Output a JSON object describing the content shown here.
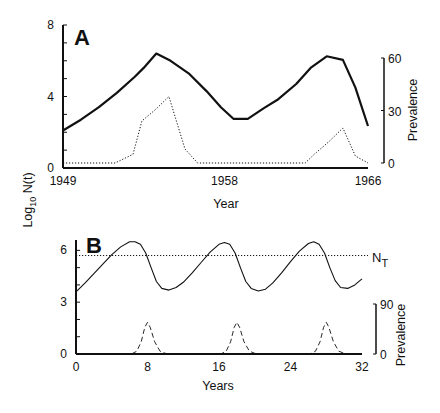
{
  "chart_data": [
    {
      "panel": "A",
      "type": "line",
      "panel_label": "A",
      "xlabel": "Year",
      "ylabel": "Log10 N(t)",
      "ylabel_parts": {
        "pre": "Log",
        "sub": "10",
        "post": " N(t)"
      },
      "y2label": "Prevalence",
      "xlim": [
        1949,
        1966
      ],
      "ylim": [
        0,
        8
      ],
      "y2lim": [
        0,
        60
      ],
      "x_ticks": [
        1949,
        1958,
        1966
      ],
      "x_tick_labels": [
        "1949",
        "1958",
        "1966"
      ],
      "y_ticks": [
        0,
        1,
        2,
        3,
        4,
        5,
        6,
        7,
        8
      ],
      "y_tick_labels": [
        {
          "value": 0,
          "label": "0"
        },
        {
          "value": 4,
          "label": "4"
        },
        {
          "value": 8,
          "label": "8"
        }
      ],
      "y2_ticks": [
        0,
        30,
        60
      ],
      "y2_tick_labels": [
        "0",
        "30",
        "60"
      ],
      "grid": false,
      "series": [
        {
          "name": "Log10 N(t)",
          "axis": "left",
          "style": "solid",
          "x": [
            1949.0,
            1950.0,
            1951.0,
            1952.0,
            1953.0,
            1953.5,
            1954.2,
            1955.0,
            1956.0,
            1957.0,
            1957.8,
            1958.5,
            1959.3,
            1960.2,
            1961.0,
            1962.0,
            1962.8,
            1963.7,
            1964.6,
            1965.3,
            1966.0
          ],
          "y": [
            2.1,
            2.7,
            3.4,
            4.2,
            5.1,
            5.6,
            6.4,
            6.0,
            5.3,
            4.3,
            3.4,
            2.75,
            2.75,
            3.35,
            3.85,
            4.7,
            5.6,
            6.25,
            6.05,
            4.5,
            2.35
          ]
        },
        {
          "name": "Prevalence",
          "axis": "right",
          "style": "dotted",
          "x": [
            1949.0,
            1951.9,
            1952.9,
            1953.4,
            1954.2,
            1954.9,
            1955.8,
            1956.5,
            1962.5,
            1963.0,
            1963.8,
            1964.6,
            1965.3,
            1966.0
          ],
          "y": [
            0,
            0,
            5,
            24,
            31,
            38,
            8,
            0,
            0,
            5,
            12,
            20,
            4,
            0
          ]
        }
      ]
    },
    {
      "panel": "B",
      "type": "line",
      "panel_label": "B",
      "xlabel": "Years",
      "ylabel": "",
      "y2label": "Prevalence",
      "xlim": [
        0,
        32
      ],
      "ylim": [
        0,
        6.5
      ],
      "y2lim": [
        0,
        90
      ],
      "x_ticks": [
        0,
        8,
        16,
        24,
        32
      ],
      "x_tick_labels": [
        "0",
        "8",
        "16",
        "24",
        "32"
      ],
      "y_ticks": [
        0,
        1,
        2,
        3,
        4,
        5,
        6
      ],
      "y_tick_labels": [
        {
          "value": 0,
          "label": "0"
        },
        {
          "value": 3,
          "label": "3"
        },
        {
          "value": 6,
          "label": "6"
        }
      ],
      "y2_ticks": [
        0,
        90
      ],
      "y2_tick_labels": [
        "0",
        "90"
      ],
      "grid": false,
      "threshold": {
        "label_main": "N",
        "label_sub": "T",
        "value": 5.7,
        "style": "dotted"
      },
      "series": [
        {
          "name": "Log10 N(t) (model)",
          "axis": "left",
          "style": "solid-thin",
          "x": [
            0,
            1,
            2,
            3,
            4,
            5,
            6,
            6.6,
            7.2,
            7.8,
            8.4,
            9.0,
            9.6,
            10.4,
            11.2,
            12,
            13,
            14,
            15,
            16,
            16.6,
            17.2,
            17.8,
            18.4,
            19.0,
            19.6,
            20.4,
            21.2,
            22,
            23,
            24,
            25,
            26,
            26.6,
            27.2,
            27.8,
            28.4,
            29.0,
            29.6,
            30.4,
            31.2,
            32
          ],
          "y": [
            3.6,
            4.1,
            4.65,
            5.2,
            5.75,
            6.2,
            6.5,
            6.5,
            6.35,
            5.85,
            5.0,
            4.2,
            3.8,
            3.7,
            3.85,
            4.15,
            4.7,
            5.3,
            5.9,
            6.35,
            6.45,
            6.35,
            5.85,
            5.0,
            4.2,
            3.8,
            3.65,
            3.75,
            4.1,
            4.7,
            5.35,
            5.95,
            6.4,
            6.5,
            6.35,
            5.85,
            5.0,
            4.25,
            3.85,
            3.8,
            4.0,
            4.35
          ]
        },
        {
          "name": "Prevalence (model)",
          "axis": "right",
          "style": "dashed",
          "x": [
            0,
            6.2,
            6.8,
            7.3,
            7.7,
            8.0,
            8.3,
            8.8,
            9.4,
            10.2,
            16.2,
            16.8,
            17.3,
            17.7,
            18.0,
            18.3,
            18.8,
            19.4,
            20.2,
            26.2,
            26.8,
            27.3,
            27.7,
            28.0,
            28.3,
            28.8,
            29.4,
            30.2,
            32
          ],
          "y": [
            0,
            0,
            5,
            22,
            48,
            57,
            48,
            22,
            5,
            0,
            0,
            5,
            22,
            48,
            57,
            48,
            22,
            5,
            0,
            0,
            5,
            22,
            48,
            57,
            48,
            22,
            5,
            0,
            0
          ]
        }
      ]
    }
  ]
}
